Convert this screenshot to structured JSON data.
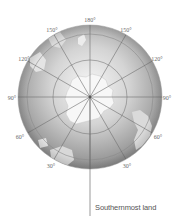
{
  "diagram": {
    "type": "polar-projection-globe",
    "center_label": "South Pole",
    "longitude_labels": [
      {
        "text": "180°",
        "x": 90,
        "y": 20
      },
      {
        "text": "150°",
        "x": 52,
        "y": 30
      },
      {
        "text": "150°",
        "x": 126,
        "y": 30
      },
      {
        "text": "120°",
        "x": 24,
        "y": 59
      },
      {
        "text": "120°",
        "x": 157,
        "y": 59
      },
      {
        "text": "90°",
        "x": 12,
        "y": 98
      },
      {
        "text": "90°",
        "x": 166,
        "y": 98
      },
      {
        "text": "60°",
        "x": 20,
        "y": 137
      },
      {
        "text": "60°",
        "x": 158,
        "y": 137
      },
      {
        "text": "30°",
        "x": 51,
        "y": 166
      },
      {
        "text": "30°",
        "x": 127,
        "y": 166
      }
    ],
    "caption": "Southernmost land",
    "colors": {
      "globe_light": "#f4f4f4",
      "globe_dark": "#8a8a8a",
      "grid": "#7a7a7a",
      "land": "#ececec"
    }
  }
}
